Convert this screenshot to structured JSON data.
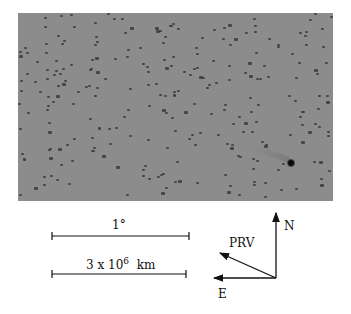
{
  "figure": {
    "scale_bars": [
      {
        "label": "1°",
        "x1": 52,
        "x2": 189,
        "y": 236,
        "label_x": 112,
        "label_y": 218
      },
      {
        "label_base": "3 x 10",
        "label_exp": "6",
        "label_unit": "km",
        "x1": 52,
        "x2": 186,
        "y": 274,
        "label_x": 86,
        "label_y": 256
      }
    ],
    "compass": {
      "origin": [
        276,
        278
      ],
      "arrows": [
        {
          "name": "N",
          "to": [
            276,
            213
          ],
          "label_x": 284,
          "label_y": 219
        },
        {
          "name": "E",
          "to": [
            214,
            278
          ],
          "label_x": 218,
          "label_y": 287
        },
        {
          "name": "PRV",
          "to": [
            220,
            253
          ],
          "label_x": 229,
          "label_y": 236
        }
      ]
    },
    "comet": {
      "x": 291,
      "y": 163
    },
    "colors": {
      "background": "#8c8c8c",
      "star": "#3a3a3a",
      "ink": "#111111"
    }
  }
}
